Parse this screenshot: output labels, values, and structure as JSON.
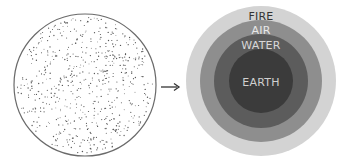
{
  "diagram": {
    "left": {
      "name": "undifferentiated-mass",
      "cx": 85,
      "cy": 85,
      "r": 71,
      "fill": "#ffffff",
      "stroke": "#6a6a6a",
      "dot_color": "#555555",
      "dot_count": 620
    },
    "arrow": {
      "x1": 161,
      "y1": 87,
      "x2": 179,
      "y2": 87,
      "color": "#333333"
    },
    "right": {
      "cx": 261,
      "cy": 81,
      "layers": [
        {
          "name": "FIRE",
          "label": "FIRE",
          "r": 75,
          "fill": "#d3d3d3",
          "text_color": "#333333",
          "label_y": 16
        },
        {
          "name": "AIR",
          "label": "AIR",
          "r": 61,
          "fill": "#8e8e8e",
          "text_color": "#e8e8e8",
          "label_y": 30
        },
        {
          "name": "WATER",
          "label": "WATER",
          "r": 47,
          "fill": "#5c5c5c",
          "text_color": "#d8d8d8",
          "label_y": 45
        },
        {
          "name": "EARTH",
          "label": "EARTH",
          "r": 32,
          "fill": "#3b3b3b",
          "text_color": "#d0d0d0",
          "label_y": 82
        }
      ]
    }
  }
}
